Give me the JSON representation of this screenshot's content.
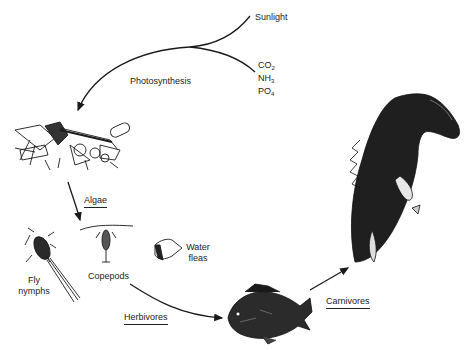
{
  "diagram": {
    "type": "food-chain",
    "inputs": {
      "sunlight": "Sunlight",
      "nutrients": [
        {
          "base": "CO",
          "sub": "2"
        },
        {
          "base": "NH",
          "sub": "3"
        },
        {
          "base": "PO",
          "sub": "4"
        }
      ]
    },
    "process_label": "Photosynthesis",
    "producers": {
      "label": "Algae"
    },
    "herbivores": {
      "label": "Herbivores",
      "organisms": [
        {
          "name_line1": "Fly",
          "name_line2": "nymphs"
        },
        {
          "name_line1": "Copepods"
        },
        {
          "name_line1": "Water",
          "name_line2": "fleas"
        }
      ]
    },
    "carnivores": {
      "label": "Carnivores"
    },
    "colors": {
      "ink": "#1a1a1a",
      "background": "#ffffff"
    }
  }
}
